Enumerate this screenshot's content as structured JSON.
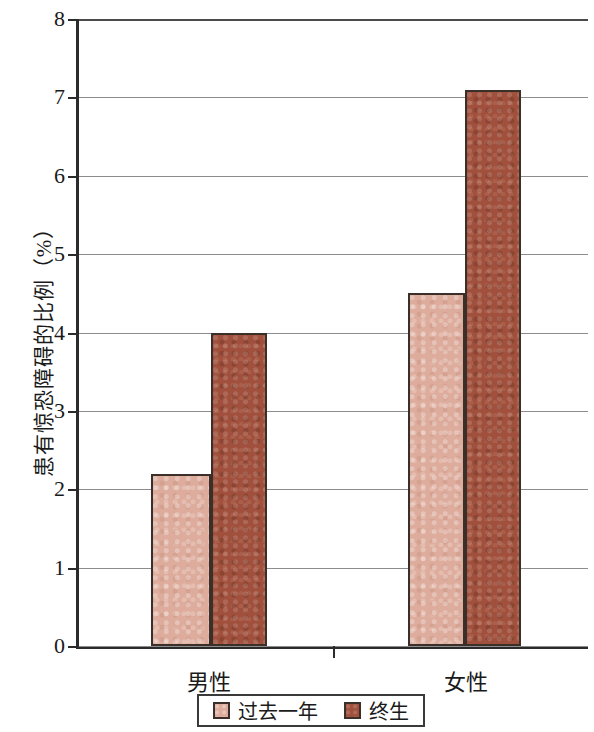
{
  "chart_data": {
    "type": "bar",
    "title": "",
    "subtitle": "",
    "xlabel": "",
    "ylabel": "患有惊恐障碍的比例（%）",
    "categories": [
      "男性",
      "女性"
    ],
    "series": [
      {
        "name": "过去一年",
        "color": "#ddac9c",
        "values": [
          2.2,
          4.5
        ]
      },
      {
        "name": "终生",
        "color": "#a0503c",
        "values": [
          4.0,
          7.1
        ]
      }
    ],
    "ylim": [
      0,
      8
    ],
    "ytick_labels": [
      "0",
      "1",
      "2",
      "3",
      "4",
      "5",
      "6",
      "7",
      "8"
    ],
    "ytick_values": [
      0,
      1,
      2,
      3,
      4,
      5,
      6,
      7,
      8
    ],
    "grid": true,
    "grid_axis": "y",
    "legend_position": "bottom-center",
    "legend_entries": [
      "过去一年",
      "终生"
    ],
    "axis_color": "#2b2b2b",
    "grid_color": "#8d8d8d",
    "bar_border_color": "#3a3029",
    "background": "#ffffff"
  }
}
